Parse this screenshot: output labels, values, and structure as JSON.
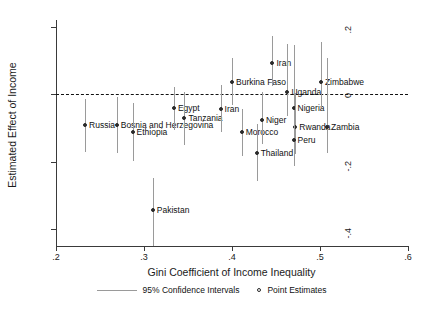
{
  "chart_data": {
    "type": "scatter",
    "title": "",
    "xlabel": "Gini Coefficient of Income Inequality",
    "ylabel": "Estimated Effect of Income",
    "xlim": [
      0.2,
      0.6
    ],
    "ylim": [
      -0.45,
      0.22
    ],
    "grid": false,
    "zero_reference_line": 0,
    "xticks": [
      ".2",
      ".3",
      ".4",
      ".5",
      ".6"
    ],
    "xtick_values": [
      0.2,
      0.3,
      0.4,
      0.5,
      0.6
    ],
    "yticks": [
      ".2",
      "0",
      "-.2",
      "-.4"
    ],
    "ytick_values": [
      0.2,
      0,
      -0.2,
      -0.4
    ],
    "legend": {
      "position": "bottom",
      "entries": [
        {
          "label": "95% Confidence Intervals",
          "marker": "line"
        },
        {
          "label": "Point Estimates",
          "marker": "circle"
        }
      ]
    },
    "points": [
      {
        "label": "Russia",
        "x": 0.233,
        "y": -0.092,
        "ci_low": -0.171,
        "ci_high": -0.013,
        "label_side": "right"
      },
      {
        "label": "Bosnia and Herzegovina",
        "x": 0.269,
        "y": -0.092,
        "ci_low": -0.175,
        "ci_high": -0.009,
        "label_side": "right"
      },
      {
        "label": "Ethiopia",
        "x": 0.287,
        "y": -0.113,
        "ci_low": -0.199,
        "ci_high": -0.027,
        "label_side": "right"
      },
      {
        "label": "Pakistan",
        "x": 0.31,
        "y": -0.342,
        "ci_low": -0.449,
        "ci_high": -0.249,
        "label_side": "right"
      },
      {
        "label": "Egypt",
        "x": 0.334,
        "y": -0.041,
        "ci_low": -0.106,
        "ci_high": 0.02,
        "label_side": "right"
      },
      {
        "label": "Tanzania",
        "x": 0.346,
        "y": -0.072,
        "ci_low": -0.151,
        "ci_high": 0.007,
        "label_side": "right"
      },
      {
        "label": "Burkina Faso",
        "x": 0.4,
        "y": 0.035,
        "ci_low": -0.033,
        "ci_high": 0.107,
        "label_side": "right"
      },
      {
        "label": "Iran",
        "x": 0.387,
        "y": -0.044,
        "ci_low": -0.113,
        "ci_high": 0.026,
        "label_side": "right"
      },
      {
        "label": "Morocco",
        "x": 0.411,
        "y": -0.113,
        "ci_low": -0.182,
        "ci_high": -0.044,
        "label_side": "right"
      },
      {
        "label": "Thailand",
        "x": 0.428,
        "y": -0.175,
        "ci_low": -0.258,
        "ci_high": -0.089,
        "label_side": "right"
      },
      {
        "label": "Iran",
        "x": 0.446,
        "y": 0.093,
        "ci_low": 0.024,
        "ci_high": 0.172,
        "label_side": "right"
      },
      {
        "label": "Niger",
        "x": 0.434,
        "y": -0.075,
        "ci_low": -0.147,
        "ci_high": 0.007,
        "label_side": "right"
      },
      {
        "label": "Uganda",
        "x": 0.463,
        "y": 0.007,
        "ci_low": -0.065,
        "ci_high": 0.148,
        "label_side": "right"
      },
      {
        "label": "Nigeria",
        "x": 0.47,
        "y": -0.041,
        "ci_low": -0.11,
        "ci_high": 0.145,
        "label_side": "right"
      },
      {
        "label": "Rwanda",
        "x": 0.472,
        "y": -0.096,
        "ci_low": -0.178,
        "ci_high": 0.003,
        "label_side": "right"
      },
      {
        "label": "Peru",
        "x": 0.47,
        "y": -0.137,
        "ci_low": -0.213,
        "ci_high": -0.058,
        "label_side": "right"
      },
      {
        "label": "Zimbabwe",
        "x": 0.501,
        "y": 0.035,
        "ci_low": -0.041,
        "ci_high": 0.155,
        "label_side": "right"
      },
      {
        "label": "Zambia",
        "x": 0.508,
        "y": -0.096,
        "ci_low": -0.175,
        "ci_high": 0.107,
        "label_side": "right"
      }
    ]
  }
}
